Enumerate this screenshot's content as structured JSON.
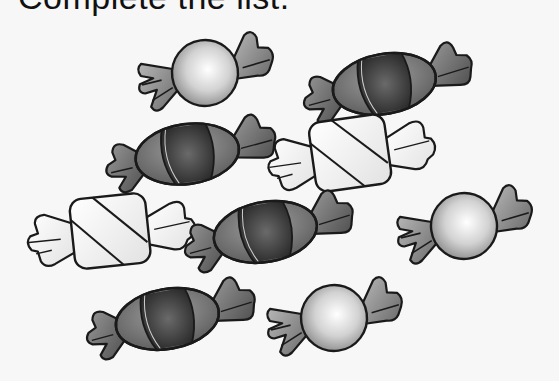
{
  "title": "Complete the list.",
  "colors": {
    "background": "#f7f7f7",
    "outline": "#1a1a1a",
    "round_light": "#f4f4f4",
    "round_dark": "#8a8a8a",
    "oval_center": "#3a3a3a",
    "oval_body": "#6e6e6e",
    "wrapper_gray": "#8c8c8c",
    "square_fill": "#f0f0f0"
  },
  "candies": [
    {
      "type": "round",
      "cx": 205,
      "cy": 73,
      "rot": -8
    },
    {
      "type": "oval",
      "cx": 384,
      "cy": 82,
      "rot": -10
    },
    {
      "type": "oval",
      "cx": 187,
      "cy": 152,
      "rot": -8
    },
    {
      "type": "square",
      "cx": 350,
      "cy": 152,
      "rot": -8
    },
    {
      "type": "square",
      "cx": 110,
      "cy": 230,
      "rot": -6
    },
    {
      "type": "oval",
      "cx": 265,
      "cy": 230,
      "rot": -10
    },
    {
      "type": "round",
      "cx": 464,
      "cy": 226,
      "rot": -8
    },
    {
      "type": "oval",
      "cx": 167,
      "cy": 317,
      "rot": -10
    },
    {
      "type": "round",
      "cx": 334,
      "cy": 318,
      "rot": -8
    }
  ]
}
